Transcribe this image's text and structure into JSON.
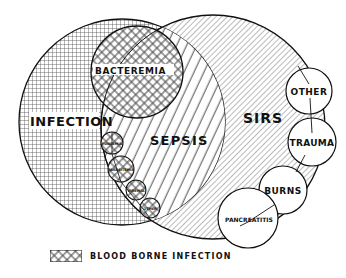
{
  "diagram": {
    "title": "",
    "regions": [
      {
        "id": "infection",
        "label": "INFECTION"
      },
      {
        "id": "sirs",
        "label": "SIRS"
      },
      {
        "id": "sepsis",
        "label": "SEPSIS"
      },
      {
        "id": "bacteremia",
        "label": "BACTEREMIA"
      }
    ],
    "infection_subtypes": [
      {
        "id": "fungemia",
        "label": "FUNGEMIA"
      },
      {
        "id": "parasitemia",
        "label": "PARASITEMIA"
      },
      {
        "id": "viremia",
        "label": "VIREMIA"
      },
      {
        "id": "other-infection",
        "label": "OTHER"
      }
    ],
    "sirs_causes": [
      {
        "id": "other",
        "label": "OTHER"
      },
      {
        "id": "trauma",
        "label": "TRAUMA"
      },
      {
        "id": "burns",
        "label": "BURNS"
      },
      {
        "id": "pancreatitis",
        "label": "PANCREATITIS"
      }
    ],
    "legend": {
      "pattern": "crosshatch-diagonal",
      "label": "BLOOD BORNE INFECTION"
    }
  }
}
